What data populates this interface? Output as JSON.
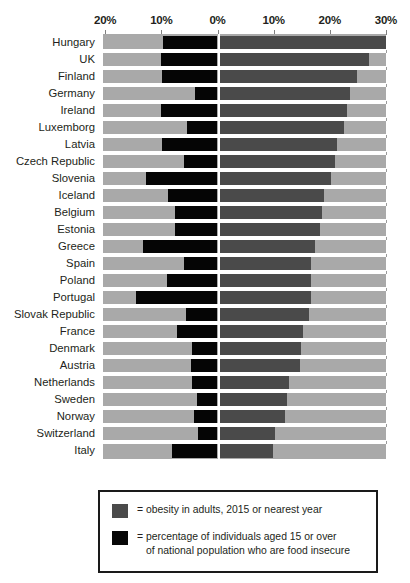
{
  "chart_data": {
    "type": "bar",
    "subtype": "diverging-horizontal-bar",
    "title": "",
    "xlabel": "",
    "ylabel": "",
    "grid": false,
    "legend_position": "bottom",
    "axis": {
      "tick_labels": [
        "20%",
        "10%",
        "0%",
        "10%",
        "20%",
        "30%"
      ],
      "tick_values": [
        -20,
        -10,
        0,
        10,
        20,
        30
      ],
      "left_axis_max": 20,
      "right_axis_max": 30,
      "xlim": [
        -20,
        30
      ]
    },
    "categories": [
      "Hungary",
      "UK",
      "Finland",
      "Germany",
      "Ireland",
      "Luxemborg",
      "Latvia",
      "Czech Republic",
      "Slovenia",
      "Iceland",
      "Belgium",
      "Estonia",
      "Greece",
      "Spain",
      "Poland",
      "Portugal",
      "Slovak Republic",
      "France",
      "Denmark",
      "Austria",
      "Netherlands",
      "Sweden",
      "Norway",
      "Switzerland",
      "Italy"
    ],
    "series": [
      {
        "name": "obesity in adults, 2015 or nearest year",
        "color": "#4a4a4a",
        "direction": "right",
        "values": [
          30.0,
          26.9,
          24.8,
          23.6,
          23.0,
          22.6,
          21.3,
          21.0,
          20.2,
          19.0,
          18.6,
          18.2,
          17.3,
          16.7,
          16.7,
          16.6,
          16.3,
          15.3,
          14.9,
          14.7,
          12.8,
          12.3,
          12.0,
          10.3,
          9.8
        ]
      },
      {
        "name": "percentage of individuals aged 15 or over of national population who are food insecure",
        "color": "#070707",
        "direction": "left",
        "values": [
          9.7,
          10.0,
          9.9,
          4.0,
          10.0,
          5.4,
          9.8,
          6.0,
          12.8,
          8.8,
          7.6,
          7.5,
          13.2,
          6.0,
          9.0,
          14.5,
          5.6,
          7.3,
          4.6,
          4.7,
          4.6,
          3.6,
          4.2,
          3.5,
          8.1
        ]
      }
    ]
  },
  "axis": {
    "ticks": [
      {
        "label": "20%",
        "value": -20
      },
      {
        "label": "10%",
        "value": -10
      },
      {
        "label": "0%",
        "value": 0
      },
      {
        "label": "10%",
        "value": 10
      },
      {
        "label": "20%",
        "value": 20
      },
      {
        "label": "30%",
        "value": 30
      }
    ]
  },
  "legend": {
    "items": [
      {
        "swatch": "obesity",
        "text": "= obesity in adults, 2015 or nearest year",
        "line2": ""
      },
      {
        "swatch": "insecure",
        "text": "= percentage of individuals aged 15 or over",
        "line2": "of national population who are food insecure"
      }
    ]
  },
  "colors": {
    "plot_background": "#a9a9a9",
    "obesity_bar": "#4a4a4a",
    "food_insecure_bar": "#070707",
    "zero_line": "#ffffff",
    "legend_border": "#1a1a1a",
    "text": "#231f20"
  }
}
